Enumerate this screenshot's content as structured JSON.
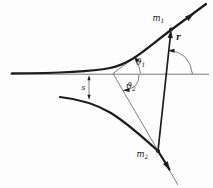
{
  "figure": {
    "labels": {
      "m1": {
        "base": "m",
        "sub": "1"
      },
      "m2": {
        "base": "m",
        "sub": "2"
      },
      "r": "r",
      "s": "s",
      "theta1": {
        "base": "ϑ",
        "sub": "1"
      },
      "theta2": {
        "base": "ϑ",
        "sub": "2"
      }
    },
    "colors": {
      "ink": "#1c1c1c",
      "thin_line": "#5f5f5f",
      "axis_line": "#6b6b6b",
      "background": "#fdfdfd"
    }
  }
}
